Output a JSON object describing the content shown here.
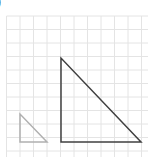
{
  "label": {
    "text": ")"
  },
  "grid": {
    "color": "#e4e4e4",
    "spacing": 13.5,
    "x_start": 6.5,
    "y_start": 16,
    "cols": 11,
    "rows": 11
  },
  "shapes": {
    "small_triangle": {
      "points": [
        [
          20,
          114
        ],
        [
          20,
          142
        ],
        [
          47,
          142
        ]
      ],
      "stroke": "#b0b0b0",
      "stroke_width": 1.5
    },
    "large_triangle": {
      "points": [
        [
          61,
          58
        ],
        [
          61,
          142
        ],
        [
          141,
          142
        ]
      ],
      "stroke": "#404040",
      "stroke_width": 1.5
    }
  }
}
